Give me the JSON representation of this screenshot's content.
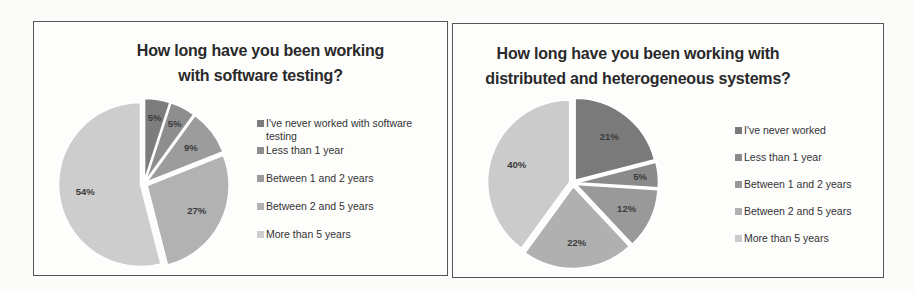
{
  "chart_data": [
    {
      "type": "pie",
      "title": "How long have you been working with software testing?",
      "title_lines": [
        "How long have you been working",
        "with software testing?"
      ],
      "categories": [
        "I've never worked with software testing",
        "Less than 1 year",
        "Between  1 and 2 years",
        "Between  2 and 5 years",
        "More than 5 years"
      ],
      "values": [
        5,
        5,
        9,
        27,
        54
      ],
      "labels": [
        "5%",
        "5%",
        "9%",
        "27%",
        "54%"
      ],
      "colors": [
        "#7d7d7d",
        "#8e8e8e",
        "#9c9c9c",
        "#b2b2b2",
        "#cdcdcd"
      ],
      "legend_position": "right",
      "exploded": true,
      "start_angle_deg": 0,
      "direction": "clockwise"
    },
    {
      "type": "pie",
      "title": "How long have you been working with distributed and heterogeneous systems?",
      "title_lines": [
        "How long have you been working with",
        "distributed and heterogeneous systems?"
      ],
      "categories": [
        "I've never worked",
        "Less than 1 year",
        "Between  1 and 2 years",
        "Between  2 and 5 years",
        "More than 5 years"
      ],
      "values": [
        21,
        5,
        12,
        22,
        40
      ],
      "labels": [
        "21%",
        "5%",
        "12%",
        "22%",
        "40%"
      ],
      "colors": [
        "#7a7a7a",
        "#8b8b8b",
        "#999999",
        "#b0b0b0",
        "#cbcbcb"
      ],
      "legend_position": "right",
      "exploded": true,
      "start_angle_deg": 0,
      "direction": "clockwise"
    }
  ],
  "left": {
    "title_line1": "How long have you been working",
    "title_line2": "with software testing?",
    "legend": [
      "I've never worked with software testing",
      "Less than 1 year",
      "Between  1 and 2 years",
      "Between  2 and 5 years",
      "More than 5 years"
    ]
  },
  "right": {
    "title_line1": "How long have you been working with",
    "title_line2": "distributed and heterogeneous systems?",
    "legend": [
      "I've never worked",
      "Less than 1 year",
      "Between  1 and 2 years",
      "Between  2 and 5 years",
      "More than 5 years"
    ]
  }
}
